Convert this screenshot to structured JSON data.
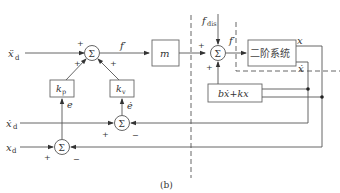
{
  "diagram": {
    "caption": "(b)",
    "inputs": {
      "accel_desired": "ẍ",
      "accel_desired_sub": "d",
      "vel_desired": "ẋ",
      "vel_desired_sub": "d",
      "pos_desired": "x",
      "pos_desired_sub": "d"
    },
    "blocks": {
      "kp": "k",
      "kp_sub": "p",
      "kv": "k",
      "kv_sub": "v",
      "mass": "m",
      "plant": "二阶系统",
      "feedback": "bẋ+kx"
    },
    "signals": {
      "f_prime_1": "f′",
      "f_prime_2": "f′",
      "f_dis": "f",
      "f_dis_sub": "dis",
      "error": "e",
      "error_dot": "ė",
      "out_x": "x",
      "out_xdot": "ẋ"
    },
    "summing_symbol": "Σ",
    "signs": {
      "sum_main_top": "+",
      "sum_main_left": "+",
      "sum_main_right": "+",
      "sum_plant_left": "+",
      "sum_plant_bottom": "+",
      "sum_vel_plus": "+",
      "sum_vel_minus": "−",
      "sum_pos_plus": "+",
      "sum_pos_minus": "−"
    }
  }
}
